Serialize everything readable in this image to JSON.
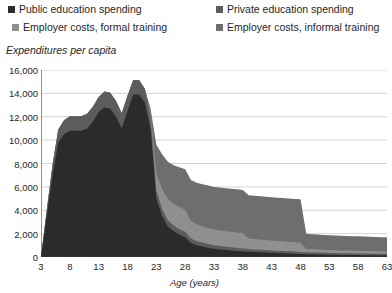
{
  "legend": {
    "items": [
      {
        "label": "Public education spending",
        "color": "#2b2b2b",
        "name": "legend-public-education"
      },
      {
        "label": "Private education spending",
        "color": "#5c5c5c",
        "name": "legend-private-education"
      },
      {
        "label": "Employer costs, formal training",
        "color": "#8f8f8f",
        "name": "legend-employer-formal"
      },
      {
        "label": "Employer costs, informal training",
        "color": "#6e6e6e",
        "name": "legend-employer-informal"
      }
    ]
  },
  "axes": {
    "y_title": "Expenditures per capita",
    "x_title": "Age (years)",
    "y_ticks": [
      "16,000",
      "14,000",
      "12,000",
      "10,000",
      "8,000",
      "6,000",
      "4,000",
      "2,000",
      "0"
    ],
    "x_ticks": [
      "3",
      "8",
      "13",
      "18",
      "23",
      "28",
      "33",
      "38",
      "43",
      "48",
      "53",
      "58",
      "63"
    ]
  },
  "chart_data": {
    "type": "area",
    "stacked": true,
    "title": "",
    "xlabel": "Age (years)",
    "ylabel": "Expenditures per capita",
    "xlim": [
      3,
      63
    ],
    "ylim": [
      0,
      16000
    ],
    "ytick_step": 2000,
    "xtick_step": 5,
    "grid": true,
    "legend_position": "top",
    "x": [
      3,
      4,
      5,
      6,
      7,
      8,
      9,
      10,
      11,
      12,
      13,
      14,
      15,
      16,
      17,
      18,
      19,
      20,
      21,
      22,
      23,
      24,
      25,
      26,
      27,
      28,
      29,
      30,
      31,
      32,
      33,
      34,
      35,
      36,
      37,
      38,
      39,
      40,
      41,
      42,
      43,
      44,
      45,
      46,
      47,
      48,
      49,
      50,
      51,
      52,
      53,
      54,
      55,
      56,
      57,
      58,
      59,
      60,
      61,
      62,
      63
    ],
    "series": [
      {
        "name": "Public education spending",
        "color": "#2b2b2b",
        "values": [
          0,
          3500,
          7000,
          9800,
          10500,
          10800,
          10800,
          10800,
          11000,
          11600,
          12400,
          12800,
          12700,
          12000,
          11000,
          12500,
          13900,
          13900,
          13200,
          11000,
          5000,
          3500,
          2600,
          2200,
          1900,
          1700,
          1200,
          1000,
          900,
          800,
          700,
          650,
          600,
          560,
          520,
          480,
          440,
          420,
          400,
          380,
          360,
          340,
          320,
          300,
          280,
          260,
          240,
          230,
          220,
          210,
          200,
          190,
          180,
          175,
          170,
          165,
          160,
          155,
          150,
          145,
          140
        ]
      },
      {
        "name": "Private education spending",
        "color": "#5c5c5c",
        "values": [
          0,
          500,
          900,
          1100,
          1200,
          1250,
          1250,
          1250,
          1250,
          1250,
          1300,
          1350,
          1350,
          1350,
          1300,
          1300,
          1250,
          1250,
          1200,
          1000,
          700,
          600,
          550,
          500,
          480,
          450,
          380,
          350,
          330,
          310,
          300,
          290,
          280,
          270,
          260,
          250,
          240,
          230,
          220,
          210,
          200,
          195,
          190,
          185,
          180,
          175,
          170,
          165,
          160,
          155,
          150,
          148,
          146,
          144,
          142,
          140,
          138,
          136,
          134,
          132,
          130
        ]
      },
      {
        "name": "Employer costs, formal training",
        "color": "#8f8f8f",
        "values": [
          0,
          0,
          0,
          0,
          0,
          0,
          0,
          0,
          0,
          0,
          0,
          0,
          0,
          0,
          0,
          0,
          0,
          0,
          0,
          300,
          1500,
          1700,
          1800,
          1850,
          1900,
          1900,
          1500,
          1450,
          1400,
          1380,
          1350,
          1340,
          1330,
          1320,
          1310,
          1300,
          900,
          880,
          870,
          860,
          850,
          840,
          830,
          820,
          810,
          800,
          280,
          270,
          260,
          255,
          250,
          245,
          240,
          235,
          230,
          225,
          220,
          215,
          210,
          205,
          200
        ]
      },
      {
        "name": "Employer costs, informal training",
        "color": "#6e6e6e",
        "values": [
          0,
          0,
          0,
          0,
          0,
          0,
          0,
          0,
          0,
          0,
          0,
          0,
          0,
          0,
          0,
          0,
          0,
          0,
          0,
          400,
          2400,
          3000,
          3200,
          3300,
          3400,
          3450,
          3500,
          3550,
          3600,
          3620,
          3650,
          3660,
          3680,
          3690,
          3700,
          3700,
          3700,
          3700,
          3700,
          3700,
          3700,
          3700,
          3700,
          3700,
          3700,
          3700,
          1300,
          1290,
          1280,
          1270,
          1260,
          1255,
          1250,
          1245,
          1240,
          1235,
          1230,
          1225,
          1220,
          1215,
          1210
        ]
      }
    ]
  }
}
